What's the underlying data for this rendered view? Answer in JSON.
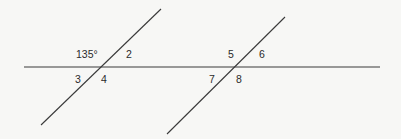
{
  "diagram": {
    "type": "parallel-lines-transversal",
    "stroke_color": "#3a3a3a",
    "background": "#f7f7f5",
    "lines": {
      "horizontal": {
        "x1": 24,
        "y1": 67,
        "x2": 380,
        "y2": 67
      },
      "transversal_left": {
        "x1": 161,
        "y1": 9,
        "x2": 41,
        "y2": 125
      },
      "transversal_right": {
        "x1": 285,
        "y1": 17,
        "x2": 167,
        "y2": 134
      }
    },
    "angles": {
      "a1": {
        "label": "135°",
        "x": 76,
        "y": 49
      },
      "a2": {
        "label": "2",
        "x": 126,
        "y": 49
      },
      "a3": {
        "label": "3",
        "x": 75,
        "y": 74
      },
      "a4": {
        "label": "4",
        "x": 101,
        "y": 74
      },
      "a5": {
        "label": "5",
        "x": 228,
        "y": 49
      },
      "a6": {
        "label": "6",
        "x": 259,
        "y": 49
      },
      "a7": {
        "label": "7",
        "x": 209,
        "y": 74
      },
      "a8": {
        "label": "8",
        "x": 236,
        "y": 74
      }
    }
  }
}
